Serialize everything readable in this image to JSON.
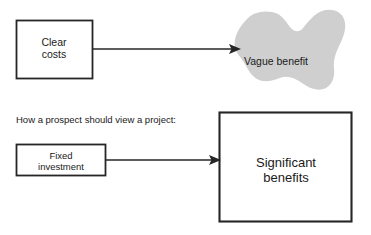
{
  "diagram": {
    "caption": "How a prospect should view a project:",
    "colors": {
      "stroke": "#262626",
      "blob_fill": "#cfcfcf",
      "box_fill": "#ffffff",
      "text": "#1a1a1a",
      "background": "#ffffff"
    },
    "top_row": {
      "source_box": {
        "label": "Clear\ncosts",
        "shape": "rectangle",
        "x": 16,
        "y": 20,
        "width": 76,
        "height": 58
      },
      "arrow": {
        "label": "",
        "from_x": 92,
        "to_x": 241,
        "y": 49,
        "head": "solid-triangle"
      },
      "target_blob": {
        "label": "Vague benefit",
        "shape": "irregular-blob",
        "fill": "#cfcfcf"
      }
    },
    "bottom_row": {
      "source_box": {
        "label": "Fixed\ninvestment",
        "shape": "rectangle",
        "x": 16,
        "y": 144,
        "width": 90,
        "height": 32
      },
      "arrow": {
        "label": "",
        "from_x": 106,
        "to_x": 221,
        "y": 160,
        "head": "solid-triangle"
      },
      "target_box": {
        "label": "Significant\nbenefits",
        "shape": "rectangle",
        "x": 219,
        "y": 112,
        "width": 133,
        "height": 110
      }
    }
  }
}
